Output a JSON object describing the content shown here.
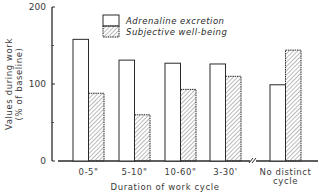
{
  "chart_data": {
    "type": "bar",
    "title": "",
    "xlabel": "Duration of work cycle",
    "ylabel": "Values during work (% of baseline)",
    "ylabel_lines": [
      "Values during work",
      "(% of baseline)"
    ],
    "ylim": [
      0,
      200
    ],
    "yticks": [
      0,
      100,
      200
    ],
    "yticks_minor": [
      50,
      150
    ],
    "grid": false,
    "legend_position": "top-center inside plot",
    "categories": [
      "0-5\"",
      "5-10\"",
      "10-60\"",
      "3-30'",
      "No distinct cycle"
    ],
    "category_lines": [
      [
        "0-5\""
      ],
      [
        "5-10\""
      ],
      [
        "10-60\""
      ],
      [
        "3-30'"
      ],
      [
        "No distinct",
        "cycle"
      ]
    ],
    "axis_break_before_category": 4,
    "series": [
      {
        "name": "Adrenaline excretion",
        "style": "open",
        "values": [
          158,
          131,
          127,
          126,
          99
        ]
      },
      {
        "name": "Subjective well-being",
        "style": "hatched",
        "values": [
          88,
          60,
          93,
          110,
          144
        ]
      }
    ]
  },
  "legend": {
    "items": [
      {
        "label": "Adrenaline excretion"
      },
      {
        "label": "Subjective well-being"
      }
    ]
  },
  "colors": {
    "ink": "#2a2a2a",
    "hatch": "#555555",
    "background": "#ffffff"
  }
}
